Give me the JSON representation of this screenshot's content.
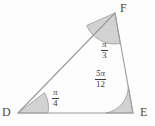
{
  "figure": {
    "type": "triangle-angle-diagram",
    "shape_name": "triangle-DEF",
    "background_color": "#fdfdfd",
    "line_color": "#9a9a9a",
    "sector_fill_color": "#d2d2d2",
    "sector_stroke_color": "#8f8f8f",
    "text_color": "#3d3d3d",
    "vertices": [
      {
        "id": "D",
        "label": "D",
        "x": 18,
        "y": 113
      },
      {
        "id": "E",
        "label": "E",
        "x": 133,
        "y": 113
      },
      {
        "id": "F",
        "label": "F",
        "x": 115,
        "y": 13
      }
    ],
    "sides": [
      {
        "from": "D",
        "to": "E"
      },
      {
        "from": "E",
        "to": "F"
      },
      {
        "from": "F",
        "to": "D"
      }
    ],
    "angles": [
      {
        "at": "D",
        "numerator": "π",
        "denominator": "4",
        "text": "π/4",
        "radians": 0.7853981634,
        "degrees": 45,
        "radius": 30
      },
      {
        "at": "E",
        "numerator": "5π",
        "denominator": "12",
        "text": "5π/12",
        "radians": 1.308996939,
        "degrees": 75,
        "radius": 27
      },
      {
        "at": "F",
        "numerator": "π",
        "denominator": "3",
        "text": "π/3",
        "radians": 1.0471975512,
        "degrees": 60,
        "radius": 31
      }
    ]
  }
}
